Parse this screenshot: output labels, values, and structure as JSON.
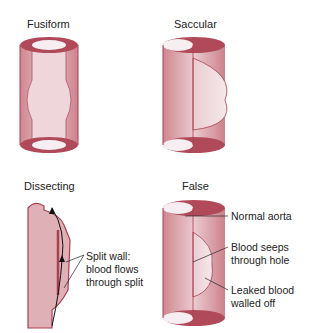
{
  "panels": {
    "fusiform": {
      "title": "Fusiform"
    },
    "saccular": {
      "title": "Saccular"
    },
    "dissecting": {
      "title": "Dissecting",
      "callout_line1": "Split wall:",
      "callout_line2": "blood flows",
      "callout_line3": "through split"
    },
    "false": {
      "title": "False",
      "callout_normal": "Normal aorta",
      "callout_seeps_line1": "Blood seeps",
      "callout_seeps_line2": "through hole",
      "callout_leaked_line1": "Leaked blood",
      "callout_leaked_line2": "walled off"
    }
  },
  "colors": {
    "vessel_wall": "#b5505e",
    "vessel_fill": "#d9a0a8",
    "vessel_light": "#f0dde0",
    "rim": "#a8404f"
  }
}
